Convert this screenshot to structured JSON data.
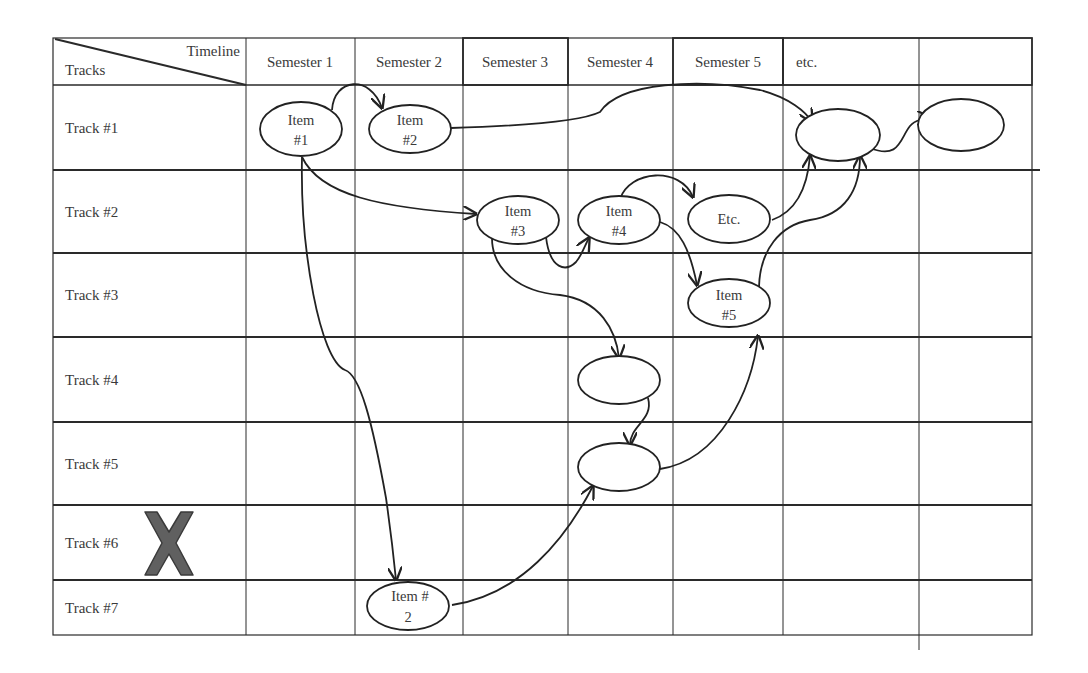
{
  "header": {
    "corner_top_label": "Timeline",
    "corner_bottom_label": "Tracks",
    "columns": [
      "Semester 1",
      "Semester 2",
      "Semester 3",
      "Semester 4",
      "Semester 5",
      "etc.",
      ""
    ]
  },
  "tracks": [
    "Track #1",
    "Track #2",
    "Track #3",
    "Track #4",
    "Track #5",
    "Track #6",
    "Track #7"
  ],
  "nodes": [
    {
      "id": "item1",
      "line1": "Item",
      "line2": "#1",
      "track": "Track #1",
      "column": "Semester 1"
    },
    {
      "id": "item2",
      "line1": "Item",
      "line2": "#2",
      "track": "Track #1",
      "column": "Semester 2"
    },
    {
      "id": "t1-etc",
      "line1": "",
      "line2": "",
      "track": "Track #1",
      "column": "etc."
    },
    {
      "id": "t1-last",
      "line1": "",
      "line2": "",
      "track": "Track #1",
      "column": ""
    },
    {
      "id": "item3",
      "line1": "Item",
      "line2": "#3",
      "track": "Track #2",
      "column": "Semester 3"
    },
    {
      "id": "item4",
      "line1": "Item",
      "line2": "#4",
      "track": "Track #2",
      "column": "Semester 4"
    },
    {
      "id": "etc",
      "line1": "Etc.",
      "line2": "",
      "track": "Track #2",
      "column": "Semester 5"
    },
    {
      "id": "item5",
      "line1": "Item",
      "line2": "#5",
      "track": "Track #3",
      "column": "Semester 5"
    },
    {
      "id": "t4-node",
      "line1": "",
      "line2": "",
      "track": "Track #4",
      "column": "Semester 4"
    },
    {
      "id": "t5-node",
      "line1": "",
      "line2": "",
      "track": "Track #5",
      "column": "Semester 4"
    },
    {
      "id": "t7-item2",
      "line1": "Item #",
      "line2": "2",
      "track": "Track #7",
      "column": "Semester 2"
    }
  ],
  "edges": [
    [
      "item1",
      "item2"
    ],
    [
      "item2",
      "t1-etc"
    ],
    [
      "t1-etc",
      "t1-last"
    ],
    [
      "item1",
      "item3"
    ],
    [
      "item1",
      "t7-item2"
    ],
    [
      "item3",
      "item4"
    ],
    [
      "item3",
      "t4-node"
    ],
    [
      "item4",
      "etc"
    ],
    [
      "item4",
      "item5"
    ],
    [
      "etc",
      "t1-etc"
    ],
    [
      "item5",
      "t1-etc"
    ],
    [
      "t4-node",
      "t5-node"
    ],
    [
      "t5-node",
      "item5"
    ],
    [
      "t7-item2",
      "t5-node"
    ]
  ],
  "markers": {
    "track6_removed": "x-mark",
    "x_color": "#5f5f5f"
  },
  "colors": {
    "line": "#2a2a2a",
    "text": "#3a3a3a",
    "background": "#ffffff"
  }
}
